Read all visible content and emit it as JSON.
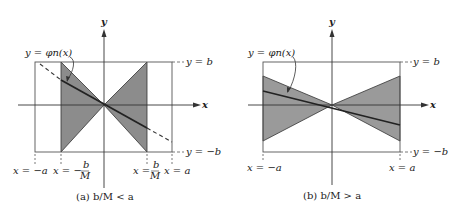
{
  "figure": {
    "panels": [
      {
        "id": "a",
        "caption": "(a) b/M < a",
        "axis_x_label": "x",
        "axis_y_label": "y",
        "curve_label": "y = φn(x)",
        "top_bound_label": "y = b",
        "bottom_bound_label": "y = −b",
        "tick_labels": {
          "neg_a": "x = −a",
          "neg_bM_prefix": "x = −",
          "bM_prefix": "x =",
          "frac_num": "b",
          "frac_den": "M",
          "pos_a": "x = a"
        }
      },
      {
        "id": "b",
        "caption": "(b) b/M > a",
        "axis_x_label": "x",
        "axis_y_label": "y",
        "curve_label": "y = φn(x)",
        "top_bound_label": "y = b",
        "bottom_bound_label": "y = −b",
        "tick_labels": {
          "neg_a": "x = −a",
          "pos_a": "x = a"
        }
      }
    ],
    "colors": {
      "shade": "#8a8a8a",
      "line": "#333333",
      "frame": "#555555"
    }
  }
}
